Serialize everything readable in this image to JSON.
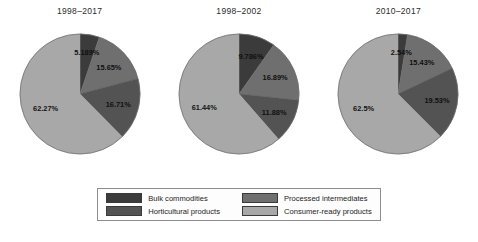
{
  "figure": {
    "background": "#ffffff"
  },
  "legend": {
    "position": "bottom-center",
    "items": [
      {
        "label": "Bulk commodities",
        "color": "#3b3b3b",
        "key": "bulk"
      },
      {
        "label": "Processed intermediates",
        "color": "#6f6f6f",
        "key": "processed"
      },
      {
        "label": "Horticultural products",
        "color": "#535353",
        "key": "horticultural"
      },
      {
        "label": "Consumer-ready products",
        "color": "#a8a8a8",
        "key": "consumer"
      }
    ]
  },
  "chart_data": [
    {
      "type": "pie",
      "title": "1998–2017",
      "categories": [
        "Bulk commodities",
        "Processed intermediates",
        "Horticultural products",
        "Consumer-ready products"
      ],
      "values": [
        5.189,
        15.65,
        16.71,
        62.27
      ],
      "labels": [
        "5.189%",
        "15.65%",
        "16.71%",
        "62.27%"
      ],
      "colors": [
        "#3b3b3b",
        "#6f6f6f",
        "#535353",
        "#a8a8a8"
      ],
      "start_angle_deg": 0,
      "direction": "clockwise"
    },
    {
      "type": "pie",
      "title": "1998–2002",
      "categories": [
        "Bulk commodities",
        "Processed intermediates",
        "Horticultural products",
        "Consumer-ready products"
      ],
      "values": [
        9.786,
        16.89,
        11.88,
        61.44
      ],
      "labels": [
        "9.786%",
        "16.89%",
        "11.88%",
        "61.44%"
      ],
      "colors": [
        "#3b3b3b",
        "#6f6f6f",
        "#535353",
        "#a8a8a8"
      ],
      "start_angle_deg": 0,
      "direction": "clockwise"
    },
    {
      "type": "pie",
      "title": "2010–2017",
      "categories": [
        "Bulk commodities",
        "Processed intermediates",
        "Horticultural products",
        "Consumer-ready products"
      ],
      "values": [
        2.54,
        15.43,
        19.53,
        62.5
      ],
      "labels": [
        "2.54%",
        "15.43%",
        "19.53%",
        "62.5%"
      ],
      "colors": [
        "#3b3b3b",
        "#6f6f6f",
        "#535353",
        "#a8a8a8"
      ],
      "start_angle_deg": 0,
      "direction": "clockwise"
    }
  ]
}
